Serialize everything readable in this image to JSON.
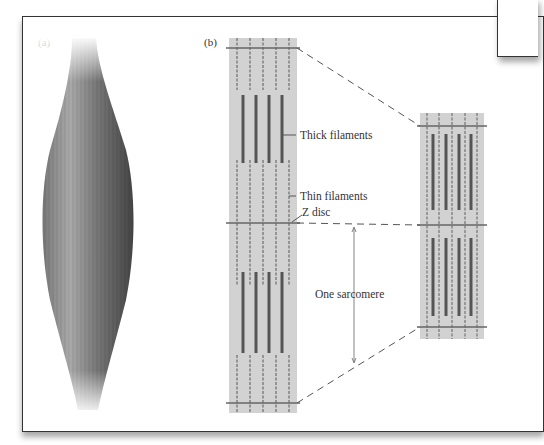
{
  "figure": {
    "panel_a": {
      "label": "(a)",
      "description": "whole skeletal muscle, fusiform shape"
    },
    "panel_b": {
      "label": "(b)",
      "annotations": {
        "thick": "Thick filaments",
        "thin": "Thin filaments",
        "zdisc": "Z disc",
        "sarcomere": "One sarcomere"
      }
    }
  },
  "colors": {
    "frame_border": "#333333",
    "column_bg": "#d2d2d2",
    "thick_filament": "#555555",
    "thin_filament": "#777777",
    "z_line": "#666666",
    "muscle_dark": "#555555",
    "muscle_light": "#a8a8a8"
  }
}
